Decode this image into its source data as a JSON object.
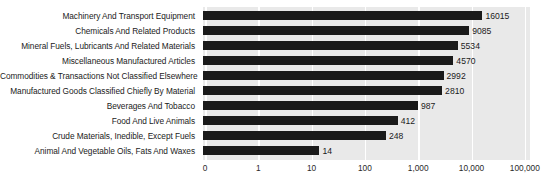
{
  "chart_data": {
    "type": "bar",
    "orientation": "horizontal",
    "title": "",
    "xlabel": "",
    "ylabel": "",
    "xscale": "log",
    "grid": true,
    "legend": "none",
    "xticks": [
      "0",
      "1",
      "10",
      "100",
      "1,000",
      "10,000",
      "100,000"
    ],
    "xtick_values": [
      0,
      1,
      10,
      100,
      1000,
      10000,
      100000
    ],
    "categories": [
      "Machinery And Transport Equipment",
      "Chemicals And Related Products",
      "Mineral Fuels, Lubricants And Related Materials",
      "Miscellaneous Manufactured Articles",
      "Commodities & Transactions Not Classified Elsewhere",
      "Manufactured Goods Classified Chiefly By Material",
      "Beverages And Tobacco",
      "Food And Live Animals",
      "Crude Materials, Inedible, Except Fuels",
      "Animal And Vegetable Oils, Fats And Waxes"
    ],
    "values": [
      16015,
      9085,
      5534,
      4570,
      2992,
      2810,
      987,
      412,
      248,
      14
    ],
    "value_labels": [
      "16015",
      "9085",
      "5534",
      "4570",
      "2992",
      "2810",
      "987",
      "412",
      "248",
      "14"
    ],
    "colors": {
      "bar": "#1a1a1a",
      "plot_background": "#e9e9e9",
      "gridline": "#ffffff",
      "text": "#1b1b1b",
      "figure_background": "#ffffff"
    }
  }
}
